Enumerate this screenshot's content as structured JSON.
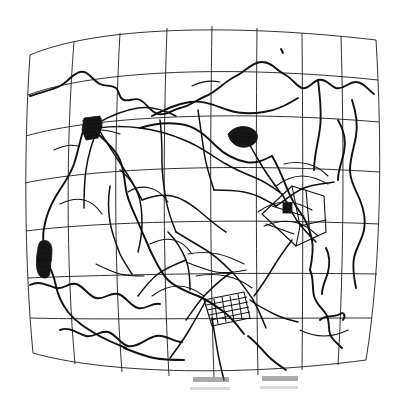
{
  "figure": {
    "kind": "scanned-hand-drawn-map",
    "title": "",
    "background_color": "#ffffff",
    "ink_color": "#111111",
    "grid_color": "#1a1a1a",
    "canvas": {
      "width": 406,
      "height": 397
    }
  },
  "graticule": {
    "description": "Barrel-distorted rectangular map grid (curved meridians and parallels)",
    "rows": 7,
    "columns": 8,
    "corners": {
      "top_left": [
        30,
        55
      ],
      "top_right": [
        376,
        40
      ],
      "bottom_left": [
        33,
        353
      ],
      "bottom_right": [
        366,
        360
      ]
    },
    "parallel_y_at_center": [
      33,
      77,
      118,
      155,
      188,
      228,
      272,
      313,
      355
    ],
    "meridian_x_at_center": [
      27,
      72,
      118,
      165,
      208,
      252,
      296,
      340,
      381
    ]
  },
  "features": [
    {
      "name": "urban-area-northwest",
      "type": "urban",
      "cx": 92,
      "cy": 127,
      "symbol": "dark-hatched-blob"
    },
    {
      "name": "lake-north-central",
      "type": "water",
      "cx": 243,
      "cy": 136,
      "symbol": "dark-lens"
    },
    {
      "name": "urban-area-southwest",
      "type": "urban",
      "cx": 45,
      "cy": 258,
      "symbol": "dark-blob"
    },
    {
      "name": "built-up-zone-south",
      "type": "urban",
      "cx": 227,
      "cy": 309,
      "symbol": "hatched-strip"
    },
    {
      "name": "field-compound-east",
      "type": "parcel",
      "cx": 300,
      "cy": 200,
      "symbol": "rectangular-outline"
    },
    {
      "name": "marker-square-east",
      "type": "marker",
      "cx": 288,
      "cy": 208,
      "symbol": "small-filled-square"
    },
    {
      "name": "marker-dot-north",
      "type": "marker",
      "cx": 282,
      "cy": 51,
      "symbol": "small-tick"
    },
    {
      "name": "arrow-mark-southeast",
      "type": "marker",
      "cx": 331,
      "cy": 318,
      "symbol": "arrow-kink"
    }
  ],
  "annotations": {
    "bottom_smudges": [
      {
        "name": "smudge-left",
        "x": 193,
        "y": 377,
        "width": 36,
        "height": 5
      },
      {
        "name": "smudge-right",
        "x": 262,
        "y": 376,
        "width": 36,
        "height": 5
      }
    ]
  },
  "legend": {
    "visible": false,
    "entries": []
  },
  "labels": {
    "visible_text": [],
    "note": "No legible text labels are rendered in this scan; only faint grey smudges below the map frame."
  }
}
